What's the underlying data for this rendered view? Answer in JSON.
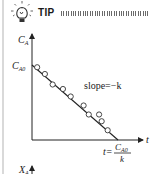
{
  "tip": {
    "icon": "lightbulb-icon",
    "label": "TIP"
  },
  "diagram": {
    "y_axis_label": "C",
    "y_axis_subscript": "A",
    "x_axis_label": "t",
    "intercept_label": "C",
    "intercept_subscript": "A0",
    "slope_label": "slope=−k",
    "x_intercept_prefix": "t=",
    "x_intercept_numerator": "C",
    "x_intercept_numerator_subscript": "A0",
    "x_intercept_denominator": "k",
    "next_axis_label": "X",
    "next_axis_subscript": "A",
    "data_points": [
      {
        "t": 0.06,
        "c": 0.97
      },
      {
        "t": 0.15,
        "c": 0.88
      },
      {
        "t": 0.24,
        "c": 0.74
      },
      {
        "t": 0.36,
        "c": 0.68
      },
      {
        "t": 0.45,
        "c": 0.58
      },
      {
        "t": 0.6,
        "c": 0.46
      },
      {
        "t": 0.66,
        "c": 0.34
      },
      {
        "t": 0.78,
        "c": 0.34
      },
      {
        "t": 0.81,
        "c": 0.25
      },
      {
        "t": 0.88,
        "c": 0.13
      }
    ]
  }
}
